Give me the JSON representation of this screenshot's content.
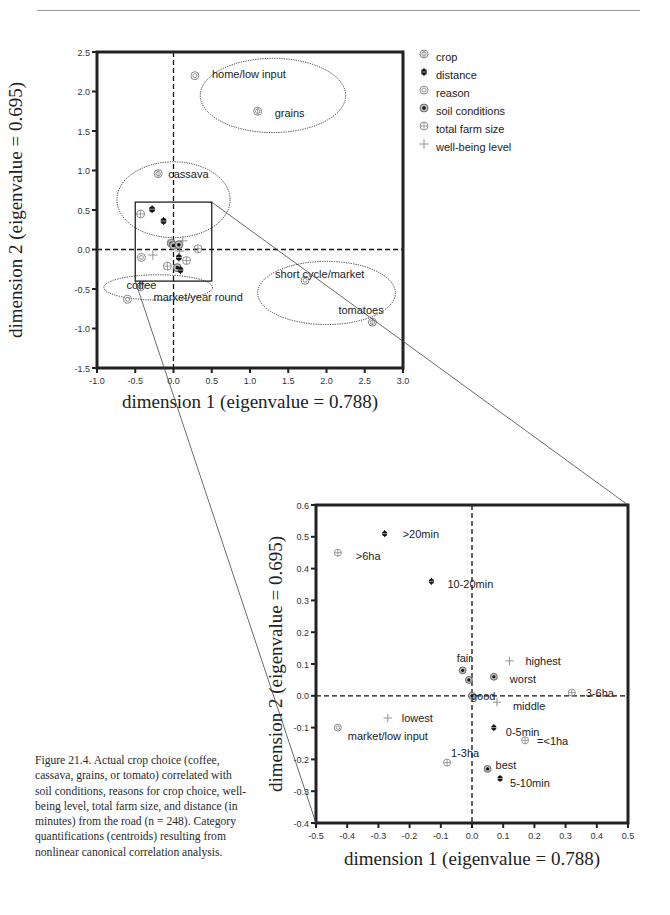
{
  "page": {
    "caption": {
      "figure_label": "Figure 21.4.",
      "text": "Actual crop choice (coffee, cassava, grains, or tomato) correlated with soil conditions, reasons for crop choice, well-being level, total farm size, and distance (in minutes) from the road (n = 248). Category quantifications (centroids) resulting from nonlinear canonical correlation analysis."
    }
  },
  "legend": {
    "items": [
      {
        "label": "crop",
        "symbol": "crop"
      },
      {
        "label": "distance",
        "symbol": "distance"
      },
      {
        "label": "reason",
        "symbol": "reason"
      },
      {
        "label": "soil conditions",
        "symbol": "soil"
      },
      {
        "label": "total farm size",
        "symbol": "farm"
      },
      {
        "label": "well-being level",
        "symbol": "wellbeing"
      }
    ]
  },
  "chart_data": [
    {
      "type": "scatter",
      "title": "",
      "xlabel": "dimension 1 (eigenvalue = 0.788)",
      "ylabel": "dimension 2 (eigenvalue = 0.695)",
      "xlim": [
        -1.0,
        3.0
      ],
      "ylim": [
        -1.5,
        2.5
      ],
      "xticks": [
        "-1.0",
        "-0.5",
        "0.0",
        "0.5",
        "1.0",
        "1.5",
        "2.0",
        "2.5",
        "3.0"
      ],
      "yticks": [
        "-1.5",
        "-1.0",
        "-0.5",
        "0.0",
        "0.5",
        "1.0",
        "1.5",
        "2.0",
        "2.5"
      ],
      "grid": false,
      "legend_position": "right",
      "reference_lines": {
        "x": 0,
        "y": 0,
        "style": "dashed"
      },
      "zoom_box": {
        "x": [
          -0.5,
          0.5
        ],
        "y": [
          -0.4,
          0.6
        ]
      },
      "ellipses": [
        {
          "group": "home/low input + grains",
          "cx": 1.3,
          "cy": 1.95,
          "rx": 0.95,
          "ry": 0.47
        },
        {
          "group": "cassava",
          "cx": 0.0,
          "cy": 0.63,
          "rx": 0.74,
          "ry": 0.48
        },
        {
          "group": "coffee + market/year round",
          "cx": -0.2,
          "cy": -0.48,
          "rx": 0.71,
          "ry": 0.16
        },
        {
          "group": "short cycle/market + tomatoes",
          "cx": 2.0,
          "cy": -0.55,
          "rx": 0.9,
          "ry": 0.4
        }
      ],
      "points": [
        {
          "series": "reason",
          "label": "home/low input",
          "x": 0.28,
          "y": 2.2
        },
        {
          "series": "crop",
          "label": "grains",
          "x": 1.1,
          "y": 1.75
        },
        {
          "series": "crop",
          "label": "cassava",
          "x": -0.2,
          "y": 0.96
        },
        {
          "series": "crop",
          "label": "coffee",
          "x": -0.43,
          "y": -0.47
        },
        {
          "series": "reason",
          "label": "market/year round",
          "x": -0.6,
          "y": -0.63
        },
        {
          "series": "reason",
          "label": "short cycle/market",
          "x": 1.72,
          "y": -0.39
        },
        {
          "series": "crop",
          "label": "tomatoes",
          "x": 2.6,
          "y": -0.92
        },
        {
          "series": "distance",
          "label": "",
          "x": -0.28,
          "y": 0.51
        },
        {
          "series": "farm",
          "label": "",
          "x": -0.43,
          "y": 0.45
        },
        {
          "series": "distance",
          "label": "",
          "x": -0.13,
          "y": 0.36
        },
        {
          "series": "soil",
          "label": "",
          "x": -0.03,
          "y": 0.08
        },
        {
          "series": "soil",
          "label": "",
          "x": 0.0,
          "y": 0.05
        },
        {
          "series": "soil",
          "label": "",
          "x": 0.07,
          "y": 0.06
        },
        {
          "series": "wellbeing",
          "label": "",
          "x": 0.12,
          "y": 0.11
        },
        {
          "series": "farm",
          "label": "",
          "x": 0.32,
          "y": 0.01
        },
        {
          "series": "wellbeing",
          "label": "",
          "x": 0.08,
          "y": -0.02
        },
        {
          "series": "reason",
          "label": "",
          "x": -0.42,
          "y": -0.1
        },
        {
          "series": "wellbeing",
          "label": "",
          "x": -0.27,
          "y": -0.07
        },
        {
          "series": "distance",
          "label": "",
          "x": 0.07,
          "y": -0.1
        },
        {
          "series": "farm",
          "label": "",
          "x": 0.17,
          "y": -0.14
        },
        {
          "series": "farm",
          "label": "",
          "x": -0.08,
          "y": -0.21
        },
        {
          "series": "soil",
          "label": "",
          "x": 0.05,
          "y": -0.23
        },
        {
          "series": "distance",
          "label": "",
          "x": 0.09,
          "y": -0.26
        }
      ]
    },
    {
      "type": "scatter",
      "title": "",
      "xlabel": "dimension 1 (eigenvalue = 0.788)",
      "ylabel": "dimension 2 (eigenvalue = 0.695)",
      "xlim": [
        -0.5,
        0.5
      ],
      "ylim": [
        -0.4,
        0.6
      ],
      "xticks": [
        "-0.5",
        "-0.4",
        "-0.3",
        "-0.2",
        "-0.1",
        "0.0",
        "0.1",
        "0.2",
        "0.3",
        "0.4",
        "0.5"
      ],
      "yticks": [
        "-0.4",
        "-0.3",
        "-0.2",
        "-0.1",
        "0.0",
        "0.1",
        "0.2",
        "0.3",
        "0.4",
        "0.5",
        "0.6"
      ],
      "grid": false,
      "reference_lines": {
        "x": 0,
        "y": 0,
        "style": "dashed"
      },
      "points": [
        {
          "series": "distance",
          "label": ">20min",
          "x": -0.28,
          "y": 0.51
        },
        {
          "series": "farm",
          "label": ">6ha",
          "x": -0.43,
          "y": 0.45
        },
        {
          "series": "distance",
          "label": "10-20min",
          "x": -0.13,
          "y": 0.36
        },
        {
          "series": "soil",
          "label": "fair",
          "x": -0.03,
          "y": 0.08
        },
        {
          "series": "soil",
          "label": "",
          "x": -0.01,
          "y": 0.05
        },
        {
          "series": "soil",
          "label": "worst",
          "x": 0.07,
          "y": 0.06
        },
        {
          "series": "wellbeing",
          "label": "highest",
          "x": 0.12,
          "y": 0.11
        },
        {
          "series": "soil",
          "label": "good",
          "x": 0.0,
          "y": 0.0
        },
        {
          "series": "farm",
          "label": "3-6ha",
          "x": 0.32,
          "y": 0.01
        },
        {
          "series": "wellbeing",
          "label": "middle",
          "x": 0.08,
          "y": -0.02
        },
        {
          "series": "reason",
          "label": "market/low input",
          "x": -0.43,
          "y": -0.1
        },
        {
          "series": "wellbeing",
          "label": "lowest",
          "x": -0.27,
          "y": -0.07
        },
        {
          "series": "distance",
          "label": "0-5min",
          "x": 0.07,
          "y": -0.1
        },
        {
          "series": "farm",
          "label": "=<1ha",
          "x": 0.17,
          "y": -0.14
        },
        {
          "series": "farm",
          "label": "1-3ha",
          "x": -0.08,
          "y": -0.21
        },
        {
          "series": "soil",
          "label": "best",
          "x": 0.05,
          "y": -0.23
        },
        {
          "series": "distance",
          "label": "5-10min",
          "x": 0.09,
          "y": -0.26
        }
      ]
    }
  ],
  "layout": {
    "plot1": {
      "left": 97,
      "right": 403,
      "top": 52,
      "bottom": 368
    },
    "plot2": {
      "left": 316,
      "right": 628,
      "top": 505,
      "bottom": 823
    },
    "label_offsets1": {
      "home/low input": [
        17,
        2
      ],
      "grains": [
        17,
        6
      ],
      "cassava": [
        10,
        4
      ],
      "coffee": [
        -14,
        2
      ],
      "market/year round": [
        26,
        2
      ],
      "short cycle/market": [
        -30,
        -2
      ],
      "tomatoes": [
        -34,
        -8
      ]
    },
    "label_offsets2": {
      ">20min": [
        18,
        4
      ],
      ">6ha": [
        18,
        7
      ],
      "10-20min": [
        16,
        7
      ],
      "fair": [
        -6,
        -8
      ],
      "worst": [
        16,
        6
      ],
      "highest": [
        16,
        4
      ],
      "good": [
        -1,
        4
      ],
      "3-6ha": [
        14,
        4
      ],
      "middle": [
        16,
        8
      ],
      "market/low input": [
        10,
        12
      ],
      "lowest": [
        14,
        4
      ],
      "0-5min": [
        12,
        8
      ],
      "=<1ha": [
        12,
        5
      ],
      "1-3ha": [
        4,
        -6
      ],
      "best": [
        8,
        0
      ],
      "5-10min": [
        10,
        9
      ]
    }
  }
}
